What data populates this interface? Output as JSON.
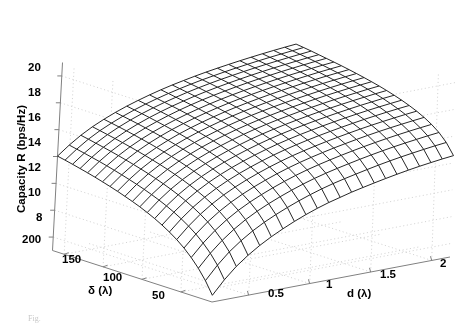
{
  "figure": {
    "kind": "matlab-3d-mesh-plot",
    "background_color": "#ffffff",
    "mesh_color": "#1a1a1a",
    "grid_color": "#c9c9c9",
    "axis_color": "#808080",
    "width": 461,
    "height": 322,
    "partial_caption": "Fig."
  },
  "axes": {
    "z": {
      "title": "Capacity R (bps/Hz)",
      "ticks": [
        "20",
        "18",
        "16",
        "14",
        "12",
        "10",
        "8"
      ],
      "tick_values": [
        20,
        18,
        16,
        14,
        12,
        10,
        8
      ],
      "range": [
        7,
        21
      ]
    },
    "x": {
      "title": "d (λ)",
      "ticks": [
        "0.5",
        "1",
        "1.5",
        "2"
      ],
      "tick_values": [
        0.5,
        1,
        1.5,
        2
      ],
      "range": [
        0.2,
        2.15
      ]
    },
    "y": {
      "title": "δ (λ)",
      "ticks": [
        "200",
        "150",
        "100",
        "50"
      ],
      "tick_values": [
        200,
        150,
        100,
        50
      ],
      "range": [
        10,
        215
      ]
    }
  },
  "chart_data": {
    "type": "surface",
    "title": "",
    "xlabel": "d (λ)",
    "ylabel": "δ (λ)",
    "zlabel": "Capacity R (bps/Hz)",
    "grid": true,
    "legend": "none",
    "x": [
      0.2,
      0.303,
      0.405,
      0.508,
      0.611,
      0.713,
      0.816,
      0.918,
      1.021,
      1.124,
      1.226,
      1.329,
      1.432,
      1.534,
      1.637,
      1.739,
      1.842,
      1.945,
      2.047,
      2.15
    ],
    "y": [
      10,
      20.8,
      31.6,
      42.4,
      53.2,
      63.9,
      74.7,
      85.5,
      96.3,
      107.1,
      117.9,
      128.7,
      139.5,
      150.3,
      161.1,
      171.8,
      182.6,
      193.4,
      204.2,
      215
    ],
    "xlim": [
      0.2,
      2.15
    ],
    "ylim": [
      10,
      215
    ],
    "zlim": [
      7,
      21
    ],
    "note": "z[j][i] rows indexed by y (delta), columns by x (d). Capacity rises monotonically with both d and delta; lowest corner ~7.5 at small d & small delta; highest corner ~20.3 at large d & large delta.",
    "z": [
      [
        7.5,
        8.6,
        9.5,
        10.2,
        10.8,
        11.3,
        11.75,
        12.15,
        12.5,
        12.8,
        13.05,
        13.3,
        13.5,
        13.7,
        13.88,
        14.05,
        14.2,
        14.33,
        14.45,
        14.55
      ],
      [
        8.5,
        9.6,
        10.5,
        11.2,
        11.8,
        12.28,
        12.7,
        13.08,
        13.42,
        13.72,
        13.98,
        14.2,
        14.4,
        14.6,
        14.78,
        14.94,
        15.08,
        15.21,
        15.33,
        15.43
      ],
      [
        9.3,
        10.35,
        11.2,
        11.9,
        12.48,
        12.95,
        13.36,
        13.73,
        14.06,
        14.35,
        14.6,
        14.82,
        15.02,
        15.21,
        15.38,
        15.54,
        15.68,
        15.8,
        15.92,
        16.02
      ],
      [
        9.95,
        10.95,
        11.78,
        12.45,
        13.0,
        13.46,
        13.86,
        14.22,
        14.54,
        14.82,
        15.06,
        15.28,
        15.48,
        15.66,
        15.83,
        15.98,
        16.12,
        16.24,
        16.35,
        16.45
      ],
      [
        10.5,
        11.45,
        12.25,
        12.9,
        13.43,
        13.88,
        14.27,
        14.62,
        14.93,
        15.2,
        15.44,
        15.65,
        15.85,
        16.02,
        16.19,
        16.34,
        16.47,
        16.59,
        16.7,
        16.8
      ],
      [
        10.95,
        11.87,
        12.64,
        13.27,
        13.79,
        14.23,
        14.61,
        14.95,
        15.25,
        15.52,
        15.75,
        15.96,
        16.15,
        16.32,
        16.48,
        16.63,
        16.76,
        16.88,
        16.99,
        17.08
      ],
      [
        11.34,
        12.23,
        12.98,
        13.59,
        14.1,
        14.53,
        14.9,
        15.23,
        15.53,
        15.79,
        16.02,
        16.23,
        16.41,
        16.58,
        16.74,
        16.88,
        17.01,
        17.13,
        17.23,
        17.33
      ],
      [
        11.68,
        12.55,
        13.28,
        13.87,
        14.37,
        14.79,
        15.16,
        15.48,
        15.77,
        16.03,
        16.26,
        16.46,
        16.64,
        16.81,
        16.96,
        17.1,
        17.23,
        17.34,
        17.45,
        17.54
      ],
      [
        11.98,
        12.83,
        13.54,
        14.12,
        14.61,
        15.03,
        15.39,
        15.7,
        15.99,
        16.24,
        16.46,
        16.66,
        16.84,
        17.01,
        17.16,
        17.29,
        17.42,
        17.53,
        17.64,
        17.73
      ],
      [
        12.25,
        13.08,
        13.78,
        14.35,
        14.83,
        15.24,
        15.59,
        15.9,
        16.18,
        16.43,
        16.65,
        16.85,
        17.02,
        17.19,
        17.33,
        17.47,
        17.59,
        17.7,
        17.81,
        17.9
      ],
      [
        12.49,
        13.31,
        14.0,
        14.56,
        15.03,
        15.43,
        15.78,
        16.08,
        16.36,
        16.6,
        16.82,
        17.01,
        17.19,
        17.35,
        17.49,
        17.63,
        17.75,
        17.86,
        17.96,
        18.05
      ],
      [
        12.71,
        13.52,
        14.2,
        14.75,
        15.21,
        15.6,
        15.95,
        16.25,
        16.52,
        16.76,
        16.98,
        17.17,
        17.34,
        17.5,
        17.64,
        17.77,
        17.89,
        18.0,
        18.1,
        18.19
      ],
      [
        12.92,
        13.71,
        14.38,
        14.92,
        15.38,
        15.77,
        16.11,
        16.4,
        16.67,
        16.91,
        17.12,
        17.31,
        17.48,
        17.64,
        17.78,
        17.91,
        18.03,
        18.13,
        18.23,
        18.32
      ],
      [
        13.11,
        13.89,
        14.55,
        15.09,
        15.53,
        15.92,
        16.26,
        16.55,
        16.81,
        17.05,
        17.26,
        17.44,
        17.61,
        17.76,
        17.9,
        18.03,
        18.15,
        18.26,
        18.35,
        18.44
      ],
      [
        13.29,
        14.06,
        14.71,
        15.24,
        15.68,
        16.06,
        16.39,
        16.68,
        16.94,
        17.17,
        17.38,
        17.57,
        17.73,
        17.88,
        18.02,
        18.15,
        18.26,
        18.37,
        18.46,
        18.55
      ],
      [
        13.46,
        14.22,
        14.86,
        15.38,
        15.82,
        16.19,
        16.52,
        16.81,
        17.07,
        17.3,
        17.5,
        17.68,
        17.85,
        18.0,
        18.13,
        18.26,
        18.37,
        18.47,
        18.57,
        18.65
      ],
      [
        13.61,
        14.36,
        15.0,
        15.52,
        15.95,
        16.32,
        16.64,
        16.93,
        17.18,
        17.41,
        17.61,
        17.79,
        17.95,
        18.1,
        18.24,
        18.36,
        18.47,
        18.57,
        18.67,
        18.75
      ],
      [
        13.76,
        14.5,
        15.13,
        15.64,
        16.07,
        16.44,
        16.76,
        17.04,
        17.29,
        17.52,
        17.72,
        17.9,
        18.06,
        18.2,
        18.34,
        18.46,
        18.57,
        18.67,
        18.76,
        18.85
      ],
      [
        13.9,
        14.63,
        15.26,
        15.76,
        16.18,
        16.55,
        16.87,
        17.15,
        17.4,
        17.62,
        17.82,
        18.0,
        18.15,
        18.3,
        18.43,
        18.55,
        18.66,
        18.76,
        18.85,
        18.94
      ],
      [
        14.03,
        14.76,
        15.38,
        15.88,
        16.29,
        16.66,
        16.97,
        17.25,
        17.5,
        17.72,
        17.91,
        18.09,
        18.25,
        18.39,
        18.52,
        18.64,
        18.75,
        18.85,
        18.94,
        19.02
      ]
    ],
    "zlabels_on_surface": []
  },
  "tick_positions": {
    "z": [
      {
        "label": "20",
        "left": 28,
        "top": 62
      },
      {
        "label": "18",
        "left": 28,
        "top": 87
      },
      {
        "label": "16",
        "left": 28,
        "top": 112
      },
      {
        "label": "14",
        "left": 28,
        "top": 137
      },
      {
        "label": "12",
        "left": 28,
        "top": 162
      },
      {
        "label": "10",
        "left": 28,
        "top": 187
      },
      {
        "label": "8",
        "left": 36,
        "top": 212
      }
    ],
    "y": [
      {
        "label": "200",
        "left": 22,
        "top": 234
      },
      {
        "label": "150",
        "left": 62,
        "top": 254
      },
      {
        "label": "100",
        "left": 103,
        "top": 272
      },
      {
        "label": "50",
        "left": 152,
        "top": 290
      }
    ],
    "x": [
      {
        "label": "0.5",
        "left": 268,
        "top": 288
      },
      {
        "label": "1",
        "left": 326,
        "top": 279
      },
      {
        "label": "1.5",
        "left": 380,
        "top": 269
      },
      {
        "label": "2",
        "left": 440,
        "top": 258
      }
    ],
    "titles": {
      "z": {
        "left": 16,
        "top": 213
      },
      "y": {
        "left": 88,
        "top": 285
      },
      "x": {
        "left": 347,
        "top": 288
      }
    }
  }
}
